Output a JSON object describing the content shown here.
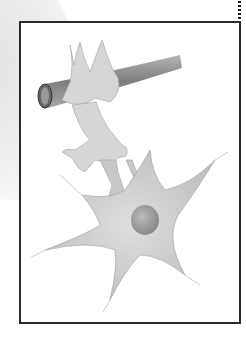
{
  "figure": {
    "elements": [
      "blood-vessel",
      "astrocyte",
      "neuron",
      "nucleus"
    ],
    "colors": {
      "frame": "#2a2a2a",
      "cell": "#cfcfcf",
      "vessel": "#8a8a8a"
    }
  }
}
